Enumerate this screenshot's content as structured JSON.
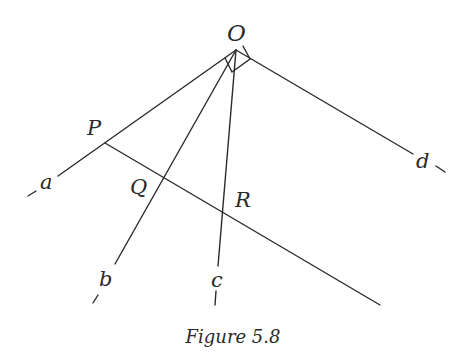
{
  "figure": {
    "caption": "Figure 5.8",
    "points": {
      "O": {
        "label": "O",
        "x": 236,
        "y": 50
      },
      "P": {
        "label": "P",
        "x": 105,
        "y": 143
      },
      "Q": {
        "label": "Q",
        "x": 163,
        "y": 176
      },
      "R": {
        "label": "R",
        "x": 222,
        "y": 210
      }
    },
    "rays": [
      {
        "name": "a",
        "label": "a"
      },
      {
        "name": "b",
        "label": "b"
      },
      {
        "name": "c",
        "label": "c"
      },
      {
        "name": "d",
        "label": "d"
      }
    ],
    "right_angle_marker": "angle aOd = 90°",
    "colors": {
      "stroke": "#2a2a2a",
      "background": "#ffffff"
    }
  }
}
